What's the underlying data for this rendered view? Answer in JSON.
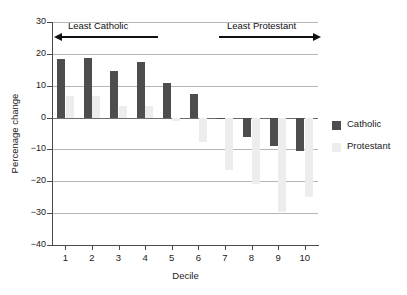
{
  "chart_data": {
    "type": "bar",
    "title": "",
    "xlabel": "Decile",
    "ylabel": "Percenage change",
    "categories": [
      "1",
      "2",
      "3",
      "4",
      "5",
      "6",
      "7",
      "8",
      "9",
      "10"
    ],
    "ylim": [
      -40,
      30
    ],
    "yticks": [
      30,
      20,
      10,
      0,
      -10,
      -20,
      -30,
      -40
    ],
    "ytick_labels": [
      "30",
      "20",
      "10",
      "0",
      "−10",
      "−20",
      "−30",
      "−40"
    ],
    "grid": true,
    "legend_position": "right",
    "series": [
      {
        "name": "Catholic",
        "color": "#4d4d4d",
        "values": [
          18.5,
          18.8,
          14.5,
          17.5,
          10.9,
          7.5,
          -0.3,
          -6.0,
          -8.8,
          -10.5
        ]
      },
      {
        "name": "Protestant",
        "color": "#ededed",
        "values": [
          6.8,
          6.8,
          3.5,
          3.5,
          -1.2,
          -7.7,
          -16.5,
          -21.0,
          -29.5,
          -25.0
        ]
      }
    ],
    "annotations": [
      {
        "text": "Least Catholic",
        "arrow": "left"
      },
      {
        "text": "Least Protestant",
        "arrow": "right"
      }
    ]
  },
  "legend": {
    "items": [
      {
        "label": "Catholic"
      },
      {
        "label": "Protestant"
      }
    ]
  }
}
